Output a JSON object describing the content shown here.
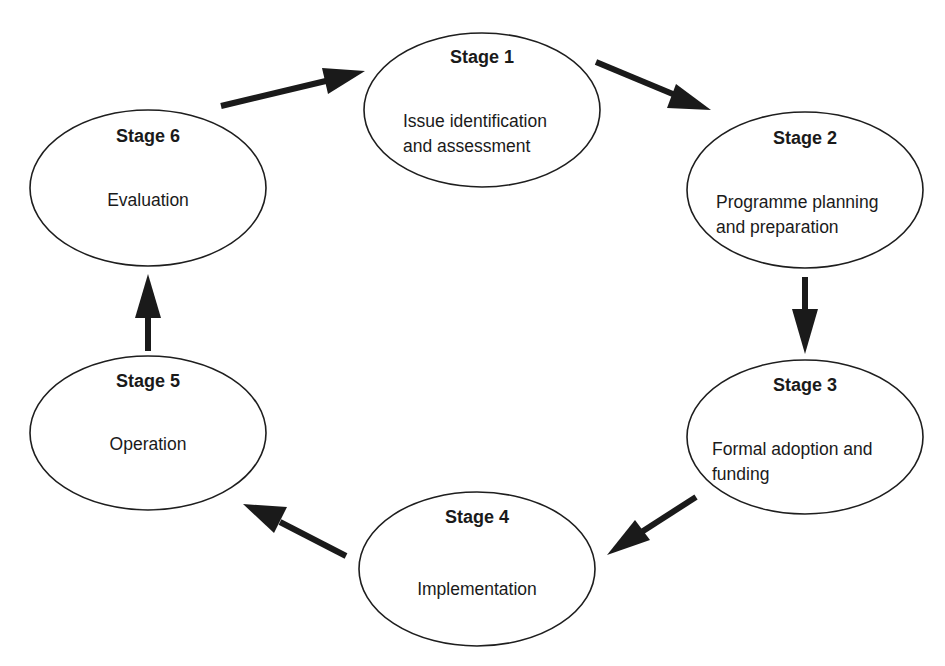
{
  "diagram": {
    "type": "cycle",
    "stages": [
      {
        "title": "Stage 1",
        "lines": [
          "Issue identification",
          "and assessment"
        ]
      },
      {
        "title": "Stage 2",
        "lines": [
          "Programme planning",
          "and preparation"
        ]
      },
      {
        "title": "Stage 3",
        "lines": [
          "Formal adoption and",
          "funding"
        ]
      },
      {
        "title": "Stage 4",
        "lines": [
          "Implementation"
        ]
      },
      {
        "title": "Stage 5",
        "lines": [
          "Operation"
        ]
      },
      {
        "title": "Stage 6",
        "lines": [
          "Evaluation"
        ]
      }
    ],
    "edges": [
      {
        "from": "Stage 1",
        "to": "Stage 2"
      },
      {
        "from": "Stage 2",
        "to": "Stage 3"
      },
      {
        "from": "Stage 3",
        "to": "Stage 4"
      },
      {
        "from": "Stage 4",
        "to": "Stage 5"
      },
      {
        "from": "Stage 5",
        "to": "Stage 6"
      },
      {
        "from": "Stage 6",
        "to": "Stage 1"
      }
    ],
    "colors": {
      "stroke": "#1e1e1e",
      "fill": "#ffffff",
      "text": "#1a1a1a"
    }
  }
}
